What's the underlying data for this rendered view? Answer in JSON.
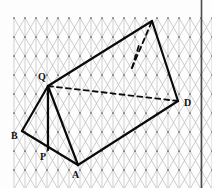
{
  "figure": {
    "background_color": "#fdfdfd",
    "border_color": "#4a4a4a",
    "grid": {
      "color": "#b9b9b9",
      "color_vertical": "#bdbdbd",
      "dot_color": "#5a5a5a",
      "spacing_x": 22,
      "spacing_y": 19,
      "origin_x": 14,
      "origin_y": 18,
      "cols": 9,
      "rows": 9,
      "style": "isometric-triangular"
    },
    "solid_color": "#0a0a0a",
    "solid_width": 2.2,
    "dashed_color": "#0a0a0a",
    "dashed_width": 1.8,
    "dash_pattern": "5,4",
    "vertices": [
      {
        "id": "Q",
        "label": "Q",
        "x": 48,
        "y": 86,
        "label_x": 38,
        "label_y": 80,
        "visible_label": true
      },
      {
        "id": "B",
        "label": "B",
        "x": 22,
        "y": 131,
        "label_x": 11,
        "label_y": 139,
        "visible_label": true
      },
      {
        "id": "P",
        "label": "P",
        "x": 48,
        "y": 150,
        "label_x": 40,
        "label_y": 160,
        "visible_label": true
      },
      {
        "id": "A",
        "label": "A",
        "x": 78,
        "y": 165,
        "label_x": 72,
        "label_y": 178,
        "visible_label": true
      },
      {
        "id": "D",
        "label": "D",
        "x": 178,
        "y": 101,
        "label_x": 184,
        "label_y": 106,
        "visible_label": true
      },
      {
        "id": "T",
        "label": "",
        "x": 152,
        "y": 21,
        "label_x": 0,
        "label_y": 0,
        "visible_label": false
      },
      {
        "id": "H",
        "label": "",
        "x": 132,
        "y": 68,
        "label_x": 0,
        "label_y": 0,
        "visible_label": false
      }
    ],
    "solid_edges": [
      {
        "name": "edge-Q-B",
        "x1": 48,
        "y1": 86,
        "x2": 22,
        "y2": 131
      },
      {
        "name": "edge-B-A",
        "x1": 22,
        "y1": 131,
        "x2": 78,
        "y2": 165
      },
      {
        "name": "edge-A-Q",
        "x1": 78,
        "y1": 165,
        "x2": 48,
        "y2": 86
      },
      {
        "name": "edge-Q-P",
        "x1": 48,
        "y1": 86,
        "x2": 48,
        "y2": 150
      },
      {
        "name": "edge-Q-T",
        "x1": 48,
        "y1": 86,
        "x2": 152,
        "y2": 21
      },
      {
        "name": "edge-T-D",
        "x1": 152,
        "y1": 21,
        "x2": 178,
        "y2": 101
      },
      {
        "name": "edge-A-D",
        "x1": 78,
        "y1": 165,
        "x2": 178,
        "y2": 101
      }
    ],
    "dashed_edges": [
      {
        "name": "hidden-edge-Q-D",
        "x1": 48,
        "y1": 86,
        "x2": 178,
        "y2": 101
      },
      {
        "name": "hidden-edge-H-T",
        "x1": 132,
        "y1": 68,
        "x2": 152,
        "y2": 21
      },
      {
        "name": "hidden-edge-H-up",
        "x1": 132,
        "y1": 68,
        "x2": 139,
        "y2": 45
      }
    ]
  }
}
